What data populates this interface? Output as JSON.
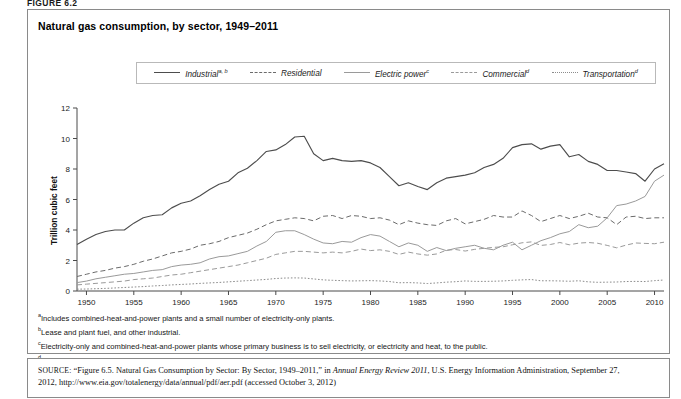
{
  "figure": {
    "label": "FIGURE 6.2",
    "title": "Natural gas consumption, by sector, 1949–2011"
  },
  "legend": {
    "items": [
      {
        "label": "Industrial",
        "sup": "a, b",
        "style": "solid-dark",
        "color": "#4d4d4d"
      },
      {
        "label": "Residential",
        "sup": "",
        "style": "dashed",
        "color": "#6b6b6b"
      },
      {
        "label": "Electric power",
        "sup": "c",
        "style": "solid-light",
        "color": "#9a9a9a"
      },
      {
        "label": "Commercial",
        "sup": "d",
        "style": "dashed-light",
        "color": "#9a9a9a"
      },
      {
        "label": "Transportation",
        "sup": "d",
        "style": "dotted",
        "color": "#8c8c8c"
      }
    ]
  },
  "axes": {
    "ylabel": "Trillion cubic feet",
    "yticks": [
      0,
      2,
      4,
      6,
      8,
      10,
      12
    ],
    "xticks": [
      1950,
      1955,
      1960,
      1965,
      1970,
      1975,
      1980,
      1985,
      1990,
      1995,
      2000,
      2005,
      2010
    ]
  },
  "footnotes": [
    {
      "mark": "a",
      "text": "Includes combined-heat-and-power plants and a small number of electricity-only plants."
    },
    {
      "mark": "b",
      "text": "Lease and plant fuel, and other industrial."
    },
    {
      "mark": "c",
      "text": "Electricity-only and combined-heat-and-power plants whose primary business is to sell electricity, or electricity and heat, to the public."
    },
    {
      "mark": "d",
      "text": "Natural gas consumed in the operation of pipelines (primarily in compressors), and as fuel in the delivery of natural gas to consumers; plus a small quantity used as vehicle fuel."
    }
  ],
  "source": {
    "prefix": "SOURCE:",
    "part1": " “Figure 6.5. Natural Gas Consumption by Sector: By Sector, 1949–2011,” in ",
    "italic": "Annual Energy Review 2011",
    "part2": ", U.S. Energy Information Administration, September 27, 2012, http://www.eia.gov/totalenergy/data/annual/pdf/aer.pdf (accessed October 3, 2012)"
  },
  "chart_data": {
    "type": "line",
    "title": "Natural gas consumption, by sector, 1949–2011",
    "xlabel": "",
    "ylabel": "Trillion cubic feet",
    "xlim": [
      1949,
      2011
    ],
    "ylim": [
      0,
      12
    ],
    "grid": false,
    "legend_position": "top",
    "x": [
      1949,
      1950,
      1951,
      1952,
      1953,
      1954,
      1955,
      1956,
      1957,
      1958,
      1959,
      1960,
      1961,
      1962,
      1963,
      1964,
      1965,
      1966,
      1967,
      1968,
      1969,
      1970,
      1971,
      1972,
      1973,
      1974,
      1975,
      1976,
      1977,
      1978,
      1979,
      1980,
      1981,
      1982,
      1983,
      1984,
      1985,
      1986,
      1987,
      1988,
      1989,
      1990,
      1991,
      1992,
      1993,
      1994,
      1995,
      1996,
      1997,
      1998,
      1999,
      2000,
      2001,
      2002,
      2003,
      2004,
      2005,
      2006,
      2007,
      2008,
      2009,
      2010,
      2011
    ],
    "series": [
      {
        "name": "Industrial",
        "style": "solid-dark",
        "color": "#4d4d4d",
        "values": [
          3.05,
          3.4,
          3.7,
          3.9,
          4.0,
          4.0,
          4.45,
          4.8,
          4.95,
          5.0,
          5.45,
          5.75,
          5.9,
          6.25,
          6.65,
          7.0,
          7.2,
          7.75,
          8.05,
          8.55,
          9.15,
          9.25,
          9.6,
          10.1,
          10.15,
          9.0,
          8.55,
          8.7,
          8.55,
          8.5,
          8.55,
          8.4,
          8.1,
          7.5,
          6.9,
          7.1,
          6.85,
          6.65,
          7.1,
          7.4,
          7.5,
          7.6,
          7.75,
          8.1,
          8.3,
          8.7,
          9.4,
          9.6,
          9.65,
          9.3,
          9.5,
          9.6,
          8.8,
          8.95,
          8.5,
          8.3,
          7.9,
          7.9,
          7.8,
          7.7,
          7.2,
          8.0,
          8.35
        ]
      },
      {
        "name": "Residential",
        "style": "dashed",
        "color": "#6b6b6b",
        "values": [
          0.95,
          1.1,
          1.25,
          1.35,
          1.5,
          1.6,
          1.75,
          1.95,
          2.1,
          2.3,
          2.5,
          2.6,
          2.75,
          3.0,
          3.1,
          3.25,
          3.5,
          3.65,
          3.8,
          4.05,
          4.35,
          4.6,
          4.7,
          4.8,
          4.75,
          4.6,
          4.9,
          4.95,
          4.75,
          4.95,
          4.9,
          4.75,
          4.8,
          4.65,
          4.35,
          4.6,
          4.45,
          4.35,
          4.3,
          4.6,
          4.75,
          4.4,
          4.55,
          4.7,
          4.95,
          4.85,
          4.85,
          5.25,
          4.95,
          4.55,
          4.75,
          4.95,
          4.75,
          4.9,
          5.1,
          4.85,
          4.8,
          4.35,
          4.85,
          4.9,
          4.75,
          4.8,
          4.8
        ]
      },
      {
        "name": "Electric power",
        "style": "solid-light",
        "color": "#9a9a9a",
        "values": [
          0.55,
          0.65,
          0.8,
          0.9,
          1.0,
          1.1,
          1.15,
          1.25,
          1.35,
          1.4,
          1.6,
          1.7,
          1.75,
          1.85,
          2.1,
          2.25,
          2.3,
          2.45,
          2.6,
          2.95,
          3.25,
          3.85,
          3.95,
          3.95,
          3.7,
          3.4,
          3.15,
          3.1,
          3.25,
          3.2,
          3.5,
          3.7,
          3.6,
          3.25,
          2.9,
          3.15,
          3.0,
          2.6,
          2.85,
          2.65,
          2.8,
          2.9,
          3.0,
          2.8,
          2.7,
          3.0,
          3.2,
          2.7,
          3.0,
          3.3,
          3.5,
          3.75,
          3.9,
          4.35,
          4.15,
          4.25,
          4.8,
          5.6,
          5.7,
          5.9,
          6.2,
          7.2,
          7.6
        ]
      },
      {
        "name": "Commercial",
        "style": "dashed-light",
        "color": "#9a9a9a",
        "values": [
          0.4,
          0.45,
          0.5,
          0.55,
          0.6,
          0.65,
          0.75,
          0.8,
          0.85,
          0.95,
          1.05,
          1.1,
          1.2,
          1.3,
          1.4,
          1.5,
          1.6,
          1.7,
          1.85,
          2.0,
          2.15,
          2.4,
          2.5,
          2.6,
          2.6,
          2.55,
          2.5,
          2.55,
          2.5,
          2.6,
          2.75,
          2.65,
          2.7,
          2.6,
          2.4,
          2.55,
          2.43,
          2.35,
          2.43,
          2.67,
          2.72,
          2.62,
          2.73,
          2.8,
          2.86,
          2.9,
          3.03,
          3.16,
          3.22,
          2.99,
          3.05,
          3.18,
          3.03,
          3.14,
          3.18,
          3.13,
          2.99,
          2.83,
          3.01,
          3.15,
          3.12,
          3.1,
          3.2
        ]
      },
      {
        "name": "Transportation",
        "style": "dotted",
        "color": "#8c8c8c",
        "values": [
          0.12,
          0.13,
          0.15,
          0.17,
          0.2,
          0.23,
          0.26,
          0.29,
          0.33,
          0.36,
          0.4,
          0.43,
          0.46,
          0.5,
          0.53,
          0.56,
          0.6,
          0.64,
          0.68,
          0.72,
          0.76,
          0.82,
          0.85,
          0.86,
          0.85,
          0.79,
          0.73,
          0.7,
          0.68,
          0.66,
          0.67,
          0.68,
          0.66,
          0.62,
          0.54,
          0.55,
          0.53,
          0.49,
          0.53,
          0.58,
          0.61,
          0.66,
          0.63,
          0.63,
          0.64,
          0.66,
          0.7,
          0.73,
          0.75,
          0.67,
          0.67,
          0.66,
          0.64,
          0.67,
          0.6,
          0.57,
          0.58,
          0.59,
          0.62,
          0.63,
          0.62,
          0.68,
          0.72
        ]
      }
    ]
  }
}
